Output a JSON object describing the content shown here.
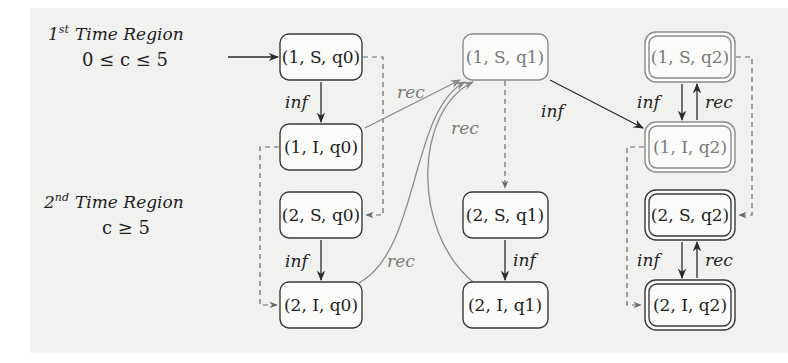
{
  "regions": [
    {
      "ordinal": "1",
      "suffix": "st",
      "title": "Time Region",
      "condition": "0 ≤ c ≤ 5"
    },
    {
      "ordinal": "2",
      "suffix": "nd",
      "title": "Time Region",
      "condition": "c ≥ 5"
    }
  ],
  "nodes": {
    "n1Sq0": "(1, S, q0)",
    "n1Iq0": "(1, I, q0)",
    "n2Sq0": "(2, S, q0)",
    "n2Iq0": "(2, I, q0)",
    "n1Sq1": "(1, S, q1)",
    "n2Sq1": "(2, S, q1)",
    "n2Iq1": "(2, I, q1)",
    "n1Sq2": "(1, S, q2)",
    "n1Iq2": "(1, I, q2)",
    "n2Sq2": "(2, S, q2)",
    "n2Iq2": "(2, I, q2)"
  },
  "edge_labels": {
    "inf_1Sq0_1Iq0": "inf",
    "rec_1Iq0_1Sq1": "rec",
    "rec_2Iq1_1Sq1": "rec",
    "inf_1Sq1_1Iq2": "inf",
    "inf_1Sq2_1Iq2": "inf",
    "rec_1Iq2_1Sq2": "rec",
    "inf_2Sq0_2Iq0": "inf",
    "rec_2Iq0_1Sq1": "rec",
    "inf_2Sq1_2Iq1": "inf",
    "inf_2Sq2_2Iq2": "inf",
    "rec_2Iq2_2Sq2": "rec"
  },
  "colors": {
    "stroke": "#3a3a3a",
    "faded": "#8a8a8a",
    "background_band": "#f1f1f0"
  }
}
